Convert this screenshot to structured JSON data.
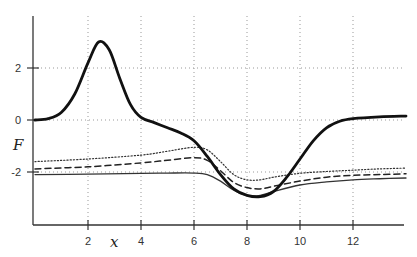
{
  "chart_data": {
    "type": "line",
    "title": "",
    "xlabel": "x",
    "ylabel": "F",
    "xlim": [
      0,
      14
    ],
    "ylim": [
      -4,
      4
    ],
    "x_ticks": [
      2,
      4,
      6,
      8,
      10,
      12
    ],
    "x_tick_labels": [
      "2",
      "4",
      "6",
      "8",
      "10",
      "12"
    ],
    "y_ticks": [
      2,
      0,
      -2
    ],
    "y_tick_labels": [
      "2",
      "0",
      "-2"
    ],
    "grid": true,
    "legend": null,
    "series": [
      {
        "name": "bold solid",
        "style": "solid-thick",
        "x": [
          0,
          0.5,
          1,
          1.5,
          2,
          2.4,
          2.8,
          3.2,
          3.6,
          4,
          4.5,
          5,
          5.5,
          6,
          6.5,
          7,
          7.5,
          8,
          8.5,
          9,
          9.5,
          10,
          10.5,
          11,
          11.5,
          12,
          13,
          14
        ],
        "y": [
          0,
          0.05,
          0.3,
          1.0,
          2.2,
          3.0,
          2.7,
          1.6,
          0.6,
          0.1,
          -0.1,
          -0.3,
          -0.5,
          -0.8,
          -1.4,
          -2.1,
          -2.65,
          -2.9,
          -2.95,
          -2.75,
          -2.2,
          -1.5,
          -0.8,
          -0.3,
          -0.05,
          0.05,
          0.12,
          0.15
        ]
      },
      {
        "name": "dotted",
        "style": "dotted",
        "x": [
          0,
          2,
          4,
          5,
          6,
          6.5,
          7,
          7.5,
          8,
          8.5,
          9,
          10,
          11,
          12,
          13,
          14
        ],
        "y": [
          -1.6,
          -1.5,
          -1.35,
          -1.2,
          -1.05,
          -1.15,
          -1.6,
          -2.1,
          -2.3,
          -2.3,
          -2.2,
          -2.05,
          -1.98,
          -1.93,
          -1.88,
          -1.85
        ]
      },
      {
        "name": "dashed",
        "style": "dashed",
        "x": [
          0,
          2,
          4,
          5,
          6,
          6.5,
          7,
          7.5,
          8,
          8.5,
          9,
          10,
          11,
          12,
          13,
          14
        ],
        "y": [
          -1.88,
          -1.8,
          -1.65,
          -1.55,
          -1.45,
          -1.55,
          -1.95,
          -2.4,
          -2.6,
          -2.65,
          -2.55,
          -2.35,
          -2.2,
          -2.13,
          -2.1,
          -2.07
        ]
      },
      {
        "name": "thin solid",
        "style": "solid-thin",
        "x": [
          0,
          2,
          4,
          5,
          6,
          6.5,
          7,
          7.5,
          8,
          8.5,
          9,
          10,
          11,
          12,
          13,
          14
        ],
        "y": [
          -2.1,
          -2.08,
          -2.05,
          -2.04,
          -2.04,
          -2.1,
          -2.35,
          -2.7,
          -2.9,
          -2.9,
          -2.75,
          -2.5,
          -2.38,
          -2.3,
          -2.26,
          -2.23
        ]
      }
    ]
  }
}
